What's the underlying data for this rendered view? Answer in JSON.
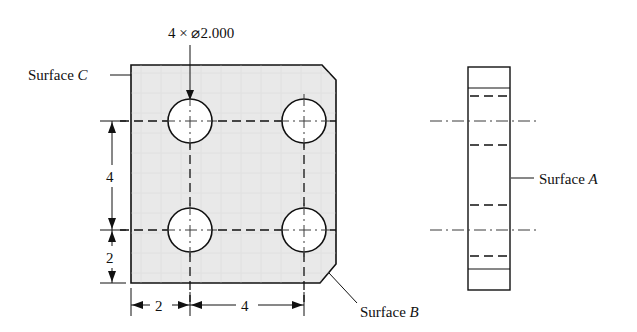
{
  "drawing": {
    "title_block": null,
    "hole_callout": "4 × ⌀2.000",
    "labels": {
      "surface_a_prefix": "Surface ",
      "surface_a_letter": "A",
      "surface_b_prefix": "Surface ",
      "surface_b_letter": "B",
      "surface_c_prefix": "Surface ",
      "surface_c_letter": "C"
    },
    "dimensions": {
      "vertical_upper": "4",
      "vertical_lower": "2",
      "horizontal_left": "2",
      "horizontal_right": "4"
    },
    "colors": {
      "plate_fill": "#e9e9e9",
      "outline": "#111111",
      "hole_fill": "#ffffff",
      "center_line": "#3b3b3b",
      "background": "#ffffff"
    },
    "front_view": {
      "plate_left": 131,
      "plate_right": 336,
      "plate_top": 65,
      "plate_bottom": 283,
      "chamfer_size": 15,
      "hole_radius": 22,
      "hole_centers_x": [
        190,
        304
      ],
      "hole_centers_y": [
        121,
        230
      ]
    },
    "side_view": {
      "left": 468,
      "right": 510,
      "top": 67,
      "bottom": 290
    }
  }
}
